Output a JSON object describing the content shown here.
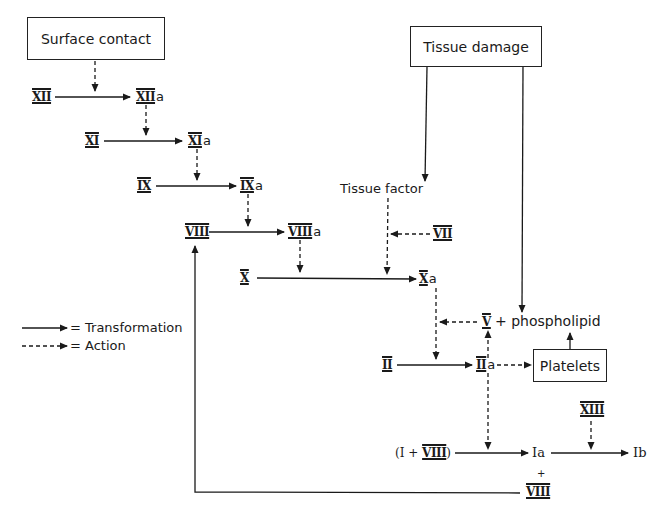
{
  "diagram": {
    "boxes": {
      "surface_contact": "Surface contact",
      "tissue_damage": "Tissue damage",
      "platelets": "Platelets"
    },
    "factors": {
      "xii": "XII",
      "xiia": "XII",
      "xi": "XI",
      "xia": "XI",
      "ix": "IX",
      "ixa": "IX",
      "viii": "VIII",
      "viiia": "VIII",
      "x": "X",
      "xa": "X",
      "vii": "VII",
      "v": "V",
      "ii": "II",
      "iia": "II",
      "xiii": "XIII",
      "viii_feedback": "VIII"
    },
    "activated_suffix": "a",
    "tissue_factor": "Tissue factor",
    "phospholipid": "+ phospholipid",
    "fibrinogen_open": "(I + ",
    "fibrinogen_viii": "VIII",
    "fibrinogen_close": ")",
    "ia": "Ia",
    "ib": "Ib",
    "plus": "+",
    "feedback_dash": "-",
    "legend": {
      "transformation": "= Transformation",
      "action": "= Action"
    }
  }
}
